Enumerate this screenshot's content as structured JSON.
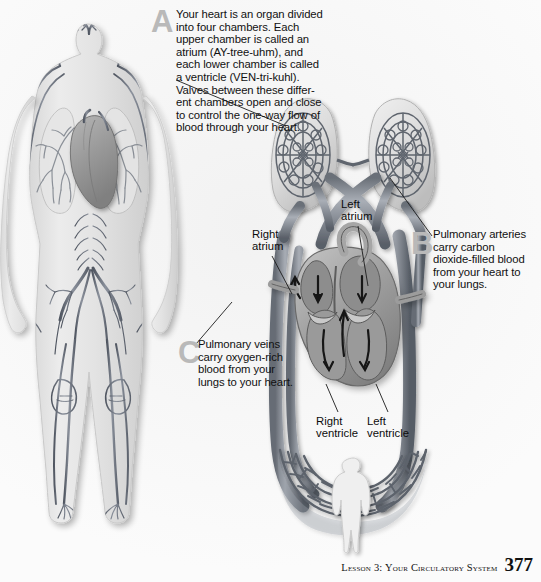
{
  "page": {
    "background_color": "#fbfbfb",
    "ink_color": "#111111",
    "marker_color": "#b9b9b9"
  },
  "callouts": [
    {
      "id": "A",
      "marker": "A",
      "text": "Your heart is an organ divided into four chambers. Each upper chamber is called an atrium (AY-tree-uhm), and each lower chamber is called a ventricle (VEN-tri-kuhl). Valves between these differ-ent chambers open and close to control the one-way flow of blood through your heart."
    },
    {
      "id": "B",
      "marker": "B",
      "text": "Pulmonary arteries carry carbon dioxide-filled blood from your heart to your lungs."
    },
    {
      "id": "C",
      "marker": "C",
      "text": "Pulmonary veins carry oxygen-rich blood from your lungs to your heart."
    }
  ],
  "anatomy_labels": {
    "right_atrium": "Right\natrium",
    "left_atrium": "Left\natrium",
    "right_ventricle": "Right\nventricle",
    "left_ventricle": "Left\nventricle"
  },
  "figures": {
    "body_diagram": "full-body-circulatory-system-illustration",
    "lungs": "pair-of-lungs-with-capillary-networks",
    "heart": "heart-cross-section-with-four-chambers-and-flow-arrows",
    "capillary_bed": "body-capillary-bed-loop",
    "silhouette": "small-human-silhouette"
  },
  "footer": {
    "lesson_title": "Lesson 3: Your Circulatory System",
    "page_number": "377"
  }
}
